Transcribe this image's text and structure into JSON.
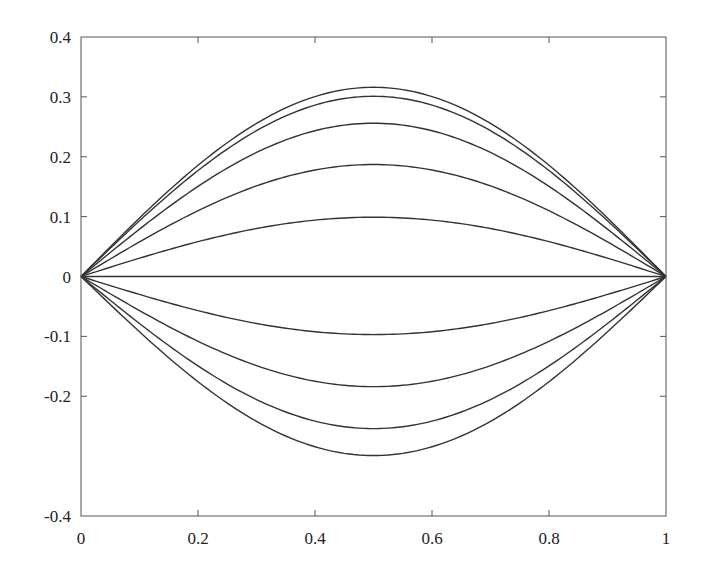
{
  "chart_data": {
    "type": "line",
    "title": "",
    "xlabel": "",
    "ylabel": "",
    "xlim": [
      0,
      1
    ],
    "ylim": [
      -0.4,
      0.4
    ],
    "grid": false,
    "legend": null,
    "x_ticks": [
      0,
      0.2,
      0.4,
      0.6,
      0.8,
      1
    ],
    "x_tick_labels": [
      "0",
      "0.2",
      "0.4",
      "0.6",
      "0.8",
      "1"
    ],
    "y_ticks": [
      -0.4,
      -0.2,
      -0.1,
      0,
      0.1,
      0.2,
      0.3,
      0.4
    ],
    "y_tick_labels": [
      "-0.4",
      "-0.2",
      "-0.1",
      "0",
      "0.1",
      "0.2",
      "0.3",
      "0.4"
    ],
    "curve_shape": "A*sin(pi*x)",
    "x": [
      0,
      0.1,
      0.2,
      0.3,
      0.4,
      0.5,
      0.6,
      0.7,
      0.8,
      0.9,
      1.0
    ],
    "series": [
      {
        "name": "curve-1",
        "amplitude": 0.316,
        "values": [
          0,
          0.098,
          0.186,
          0.256,
          0.301,
          0.316,
          0.301,
          0.256,
          0.186,
          0.098,
          0
        ]
      },
      {
        "name": "curve-2",
        "amplitude": 0.301,
        "values": [
          0,
          0.093,
          0.177,
          0.244,
          0.286,
          0.301,
          0.286,
          0.244,
          0.177,
          0.093,
          0
        ]
      },
      {
        "name": "curve-3",
        "amplitude": 0.256,
        "values": [
          0,
          0.079,
          0.15,
          0.207,
          0.243,
          0.256,
          0.243,
          0.207,
          0.15,
          0.079,
          0
        ]
      },
      {
        "name": "curve-4",
        "amplitude": 0.187,
        "values": [
          0,
          0.058,
          0.11,
          0.151,
          0.178,
          0.187,
          0.178,
          0.151,
          0.11,
          0.058,
          0
        ]
      },
      {
        "name": "curve-5",
        "amplitude": 0.099,
        "values": [
          0,
          0.031,
          0.058,
          0.08,
          0.094,
          0.099,
          0.094,
          0.08,
          0.058,
          0.031,
          0
        ]
      },
      {
        "name": "curve-6",
        "amplitude": 0.0,
        "values": [
          0,
          0,
          0,
          0,
          0,
          0,
          0,
          0,
          0,
          0,
          0
        ]
      },
      {
        "name": "curve-7",
        "amplitude": -0.097,
        "values": [
          0,
          -0.03,
          -0.057,
          -0.078,
          -0.092,
          -0.097,
          -0.092,
          -0.078,
          -0.057,
          -0.03,
          0
        ]
      },
      {
        "name": "curve-8",
        "amplitude": -0.184,
        "values": [
          0,
          -0.057,
          -0.108,
          -0.149,
          -0.175,
          -0.184,
          -0.175,
          -0.149,
          -0.108,
          -0.057,
          0
        ]
      },
      {
        "name": "curve-9",
        "amplitude": -0.254,
        "values": [
          0,
          -0.078,
          -0.149,
          -0.205,
          -0.242,
          -0.254,
          -0.242,
          -0.205,
          -0.149,
          -0.078,
          0
        ]
      },
      {
        "name": "curve-10",
        "amplitude": -0.299,
        "values": [
          0,
          -0.092,
          -0.176,
          -0.242,
          -0.284,
          -0.299,
          -0.284,
          -0.242,
          -0.176,
          -0.092,
          0
        ]
      }
    ]
  },
  "layout": {
    "plot_left": 81,
    "plot_right": 666,
    "plot_top": 37,
    "plot_bottom": 516
  }
}
